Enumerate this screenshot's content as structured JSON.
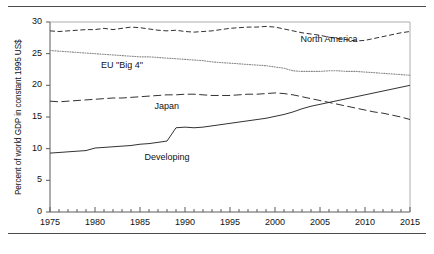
{
  "figure": {
    "ylabel": "Percent of world GDP in constant 1995 US$",
    "yticks": [
      "0",
      "5",
      "10",
      "15",
      "20",
      "25",
      "30"
    ],
    "xticks": [
      "1975",
      "1980",
      "1985",
      "1990",
      "1995",
      "2000",
      "2005",
      "2010",
      "2015"
    ],
    "labels": {
      "north_america": "North America",
      "eu_big4": "EU \"Big 4\"",
      "japan": "Japan",
      "developing": "Developing"
    }
  },
  "chart_data": {
    "type": "line",
    "title": "",
    "xlabel": "",
    "ylabel": "Percent of world GDP in constant 1995 US$",
    "xlim": [
      1975,
      2015
    ],
    "ylim": [
      0,
      30
    ],
    "xtick_step": 5,
    "ytick_step": 5,
    "minor_xticks": "annual",
    "grid": false,
    "legend": "inline-annotations",
    "x": [
      1975,
      1976,
      1977,
      1978,
      1979,
      1980,
      1981,
      1982,
      1983,
      1984,
      1985,
      1986,
      1987,
      1988,
      1989,
      1990,
      1991,
      1992,
      1993,
      1994,
      1995,
      1996,
      1997,
      1998,
      1999,
      2000,
      2001,
      2002,
      2003,
      2004,
      2005,
      2006,
      2007,
      2008,
      2009,
      2010,
      2011,
      2012,
      2013,
      2014,
      2015
    ],
    "series": [
      {
        "name": "North America",
        "linestyle": "dashed",
        "color": "#333333",
        "values": [
          28.6,
          28.5,
          28.6,
          28.7,
          28.8,
          28.8,
          29.0,
          28.8,
          29.0,
          29.2,
          29.1,
          28.9,
          28.7,
          28.6,
          28.7,
          28.5,
          28.4,
          28.5,
          28.6,
          28.8,
          29.0,
          29.1,
          29.2,
          29.2,
          29.3,
          29.2,
          28.9,
          28.6,
          28.3,
          28.1,
          27.9,
          27.6,
          27.4,
          27.2,
          27.0,
          27.1,
          27.4,
          27.7,
          28.0,
          28.3,
          28.5
        ]
      },
      {
        "name": "EU \"Big 4\"",
        "linestyle": "dotted",
        "color": "#8a8a8a",
        "values": [
          25.5,
          25.4,
          25.3,
          25.2,
          25.1,
          25.0,
          24.9,
          24.8,
          24.7,
          24.6,
          24.5,
          24.5,
          24.4,
          24.3,
          24.2,
          24.1,
          24.0,
          23.9,
          23.7,
          23.6,
          23.5,
          23.4,
          23.3,
          23.2,
          23.1,
          22.9,
          22.7,
          22.3,
          22.2,
          22.2,
          22.2,
          22.3,
          22.3,
          22.2,
          22.2,
          22.1,
          22.0,
          21.9,
          21.8,
          21.7,
          21.6
        ]
      },
      {
        "name": "Japan",
        "linestyle": "long-dash",
        "color": "#333333",
        "values": [
          17.5,
          17.4,
          17.5,
          17.6,
          17.7,
          17.8,
          17.9,
          18.0,
          18.0,
          18.1,
          18.2,
          18.3,
          18.4,
          18.5,
          18.5,
          18.6,
          18.6,
          18.5,
          18.4,
          18.4,
          18.4,
          18.5,
          18.6,
          18.6,
          18.7,
          18.8,
          18.7,
          18.5,
          18.2,
          17.9,
          17.6,
          17.3,
          17.0,
          16.7,
          16.4,
          16.1,
          15.8,
          15.6,
          15.3,
          15.0,
          14.6
        ]
      },
      {
        "name": "Developing",
        "linestyle": "solid",
        "color": "#333333",
        "values": [
          9.3,
          9.4,
          9.5,
          9.6,
          9.7,
          10.1,
          10.2,
          10.3,
          10.4,
          10.5,
          10.7,
          10.8,
          11.0,
          11.2,
          13.3,
          13.4,
          13.3,
          13.4,
          13.6,
          13.8,
          14.0,
          14.2,
          14.4,
          14.6,
          14.8,
          15.1,
          15.4,
          15.8,
          16.3,
          16.7,
          17.0,
          17.3,
          17.6,
          17.9,
          18.2,
          18.5,
          18.8,
          19.1,
          19.4,
          19.7,
          20.0
        ]
      }
    ],
    "annotations": [
      {
        "text": "North America",
        "x": 2006,
        "y": 27.2
      },
      {
        "text": "EU \"Big 4\"",
        "x": 1983,
        "y": 23.0
      },
      {
        "text": "Japan",
        "x": 1988,
        "y": 16.6
      },
      {
        "text": "Developing",
        "x": 1988,
        "y": 8.6
      }
    ]
  }
}
